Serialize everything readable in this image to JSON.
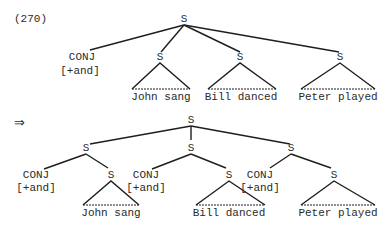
{
  "example_number": "(270)",
  "arrow": "⇒",
  "tree_before": {
    "root": "S",
    "conj": {
      "label": "CONJ",
      "feature": "[+and]"
    },
    "clauses": [
      {
        "label": "S",
        "text": "John sang"
      },
      {
        "label": "S",
        "text": "Bill danced"
      },
      {
        "label": "S",
        "text": "Peter played"
      }
    ]
  },
  "tree_after": {
    "root": "S",
    "conjuncts": [
      {
        "label": "S",
        "conj": {
          "label": "CONJ",
          "feature": "[+and]"
        },
        "clause": {
          "label": "S",
          "text": "John sang"
        }
      },
      {
        "label": "S",
        "conj": {
          "label": "CONJ",
          "feature": "[+and]"
        },
        "clause": {
          "label": "S",
          "text": "Bill danced"
        }
      },
      {
        "label": "S",
        "conj": {
          "label": "CONJ",
          "feature": "[+and]"
        },
        "clause": {
          "label": "S",
          "text": "Peter played"
        }
      }
    ]
  }
}
